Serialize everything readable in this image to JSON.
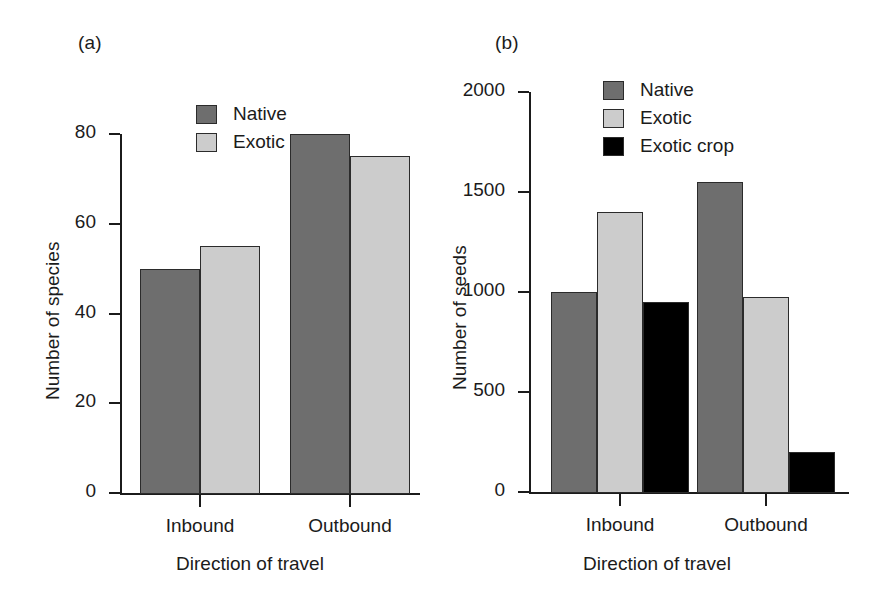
{
  "figure": {
    "background": "#ffffff",
    "panels": [
      {
        "tag": "(a)",
        "ylabel": "Number of species",
        "xlabel": "Direction of travel"
      },
      {
        "tag": "(b)",
        "ylabel": "Number of seeds",
        "xlabel": "Direction of travel"
      }
    ]
  },
  "colors": {
    "native": "#6e6e6e",
    "exotic": "#cccccc",
    "exotic_crop": "#000000",
    "axis": "#1b1b1b",
    "bar_outline": "#2b2b2b"
  },
  "chart_data": [
    {
      "type": "bar",
      "panel": "(a)",
      "title": "",
      "xlabel": "Direction of travel",
      "ylabel": "Number of species",
      "categories": [
        "Inbound",
        "Outbound"
      ],
      "yticks": [
        0,
        20,
        40,
        60,
        80
      ],
      "ylim": [
        0,
        80
      ],
      "grid": false,
      "legend_position": "top-left-inside",
      "series": [
        {
          "name": "Native",
          "color": "#6e6e6e",
          "values": [
            50,
            80
          ]
        },
        {
          "name": "Exotic",
          "color": "#cccccc",
          "values": [
            55,
            75
          ]
        }
      ]
    },
    {
      "type": "bar",
      "panel": "(b)",
      "title": "",
      "xlabel": "Direction of travel",
      "ylabel": "Number of seeds",
      "categories": [
        "Inbound",
        "Outbound"
      ],
      "yticks": [
        0,
        500,
        1000,
        1500,
        2000
      ],
      "ylim": [
        0,
        2000
      ],
      "grid": false,
      "legend_position": "top-left-inside",
      "series": [
        {
          "name": "Native",
          "color": "#6e6e6e",
          "values": [
            1000,
            1550
          ]
        },
        {
          "name": "Exotic",
          "color": "#cccccc",
          "values": [
            1400,
            975
          ]
        },
        {
          "name": "Exotic crop",
          "color": "#000000",
          "values": [
            950,
            200
          ]
        }
      ]
    }
  ]
}
